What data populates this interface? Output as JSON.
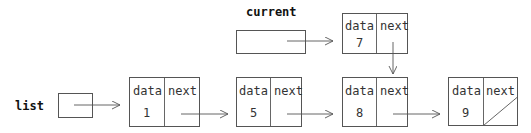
{
  "labels": {
    "list": "list",
    "current": "current"
  },
  "node_fields": {
    "data": "data",
    "next": "next"
  },
  "nodes": [
    {
      "id": "n1",
      "value": "1",
      "next": "n5"
    },
    {
      "id": "n5",
      "value": "5",
      "next": "n8"
    },
    {
      "id": "n7",
      "value": "7",
      "next": "n8"
    },
    {
      "id": "n8",
      "value": "8",
      "next": "n9"
    },
    {
      "id": "n9",
      "value": "9",
      "next": null
    }
  ],
  "pointers": [
    {
      "name": "list",
      "target": "n1"
    },
    {
      "name": "current",
      "target": "n7"
    }
  ],
  "colors": {
    "stroke": "#555555",
    "text": "#333333"
  }
}
